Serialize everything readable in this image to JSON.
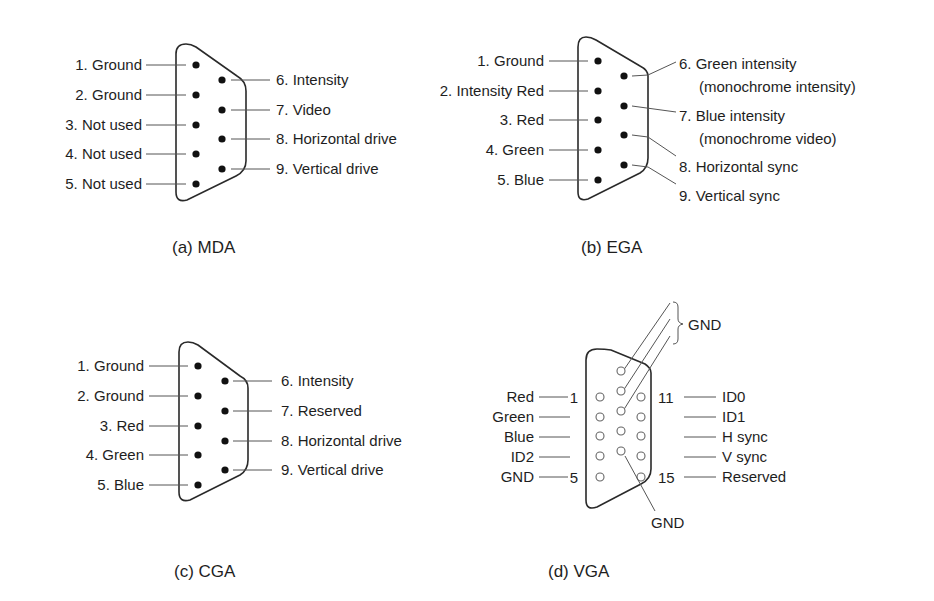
{
  "figure": {
    "panels": [
      {
        "id": "mda",
        "caption": "(a) MDA",
        "left_pins": [
          "1. Ground",
          "2. Ground",
          "3. Not used",
          "4. Not used",
          "5. Not used"
        ],
        "right_pins": [
          "6. Intensity",
          "7. Video",
          "8. Horizontal drive",
          "9. Vertical drive"
        ]
      },
      {
        "id": "ega",
        "caption": "(b) EGA",
        "left_pins": [
          "1. Ground",
          "2. Intensity Red",
          "3. Red",
          "4. Green",
          "5. Blue"
        ],
        "right_pins": [
          {
            "line1": "6. Green intensity",
            "line2": "(monochrome intensity)"
          },
          {
            "line1": "7. Blue intensity",
            "line2": "(monochrome video)"
          },
          {
            "line1": "8. Horizontal sync"
          },
          {
            "line1": "9. Vertical sync"
          }
        ]
      },
      {
        "id": "cga",
        "caption": "(c) CGA",
        "left_pins": [
          "1. Ground",
          "2. Ground",
          "3. Red",
          "4. Green",
          "5. Blue"
        ],
        "right_pins": [
          "6. Intensity",
          "7. Reserved",
          "8. Horizontal drive",
          "9. Vertical drive"
        ]
      },
      {
        "id": "vga",
        "caption": "(d) VGA",
        "left_pins": [
          "Red",
          "Green",
          "Blue",
          "ID2",
          "GND"
        ],
        "right_pins": [
          "ID0",
          "ID1",
          "H sync",
          "V sync",
          "Reserved"
        ],
        "pin_numbers": {
          "first": "1",
          "fifth": "5",
          "eleventh": "11",
          "fifteenth": "15"
        },
        "top_group_label": "GND",
        "bottom_label": "GND"
      }
    ]
  }
}
